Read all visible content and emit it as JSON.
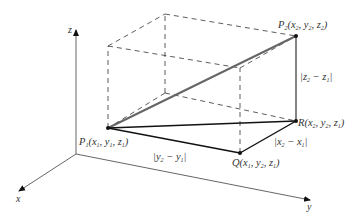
{
  "diagram": {
    "type": "3d-distance-between-points",
    "axes": {
      "x": {
        "label": "x"
      },
      "y": {
        "label": "y"
      },
      "z": {
        "label": "z"
      }
    },
    "points": {
      "P1": {
        "name": "P",
        "sub": "1",
        "coords": "(x1, y1, z1)"
      },
      "P2": {
        "name": "P",
        "sub": "2",
        "coords": "(x2, y2, z2)"
      },
      "Q": {
        "name": "Q",
        "coords": "(x1, y2, z1)"
      },
      "R": {
        "name": "R",
        "coords": "(x2, y2, z1)"
      }
    },
    "segment_labels": {
      "y_diff": "|y2 − y1|",
      "x_diff": "|x2 − x1|",
      "z_diff": "|z2 − z1|"
    },
    "colors": {
      "line": "#1a1a1a",
      "diagonal": "#555555",
      "dashed": "#333333",
      "axis": "#444444",
      "text": "#333333"
    }
  }
}
